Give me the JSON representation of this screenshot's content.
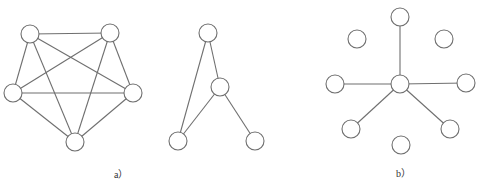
{
  "figure": {
    "panels": [
      {
        "id": "a",
        "caption": "a）",
        "graphs": [
          {
            "name": "complete-graph-k5",
            "nodes": [
              {
                "id": "n1",
                "x": 30,
                "y": 34
              },
              {
                "id": "n2",
                "x": 110,
                "y": 33
              },
              {
                "id": "n3",
                "x": 133,
                "y": 93
              },
              {
                "id": "n4",
                "x": 75,
                "y": 142
              },
              {
                "id": "n5",
                "x": 13,
                "y": 93
              }
            ],
            "edges": [
              [
                "n1",
                "n2"
              ],
              [
                "n1",
                "n3"
              ],
              [
                "n1",
                "n4"
              ],
              [
                "n1",
                "n5"
              ],
              [
                "n2",
                "n3"
              ],
              [
                "n2",
                "n4"
              ],
              [
                "n2",
                "n5"
              ],
              [
                "n3",
                "n4"
              ],
              [
                "n3",
                "n5"
              ],
              [
                "n4",
                "n5"
              ]
            ]
          },
          {
            "name": "small-graph",
            "nodes": [
              {
                "id": "m1",
                "x": 208,
                "y": 33
              },
              {
                "id": "m2",
                "x": 220,
                "y": 87
              },
              {
                "id": "m3",
                "x": 178,
                "y": 141
              },
              {
                "id": "m4",
                "x": 255,
                "y": 141
              }
            ],
            "edges": [
              [
                "m1",
                "m3"
              ],
              [
                "m1",
                "m2"
              ],
              [
                "m2",
                "m3"
              ],
              [
                "m2",
                "m4"
              ]
            ]
          }
        ]
      },
      {
        "id": "b",
        "caption": "b）",
        "graphs": [
          {
            "name": "star-graph-with-isolated-nodes",
            "nodes": [
              {
                "id": "c",
                "x": 400,
                "y": 84
              },
              {
                "id": "top",
                "x": 400,
                "y": 17
              },
              {
                "id": "ul",
                "x": 357,
                "y": 39
              },
              {
                "id": "ur",
                "x": 444,
                "y": 39
              },
              {
                "id": "left",
                "x": 335,
                "y": 84
              },
              {
                "id": "right",
                "x": 466,
                "y": 83
              },
              {
                "id": "ll",
                "x": 351,
                "y": 129
              },
              {
                "id": "lr",
                "x": 450,
                "y": 129
              },
              {
                "id": "bottom",
                "x": 401,
                "y": 145
              }
            ],
            "edges": [
              [
                "c",
                "top"
              ],
              [
                "c",
                "left"
              ],
              [
                "c",
                "right"
              ],
              [
                "c",
                "ll"
              ],
              [
                "c",
                "lr"
              ]
            ]
          }
        ]
      }
    ],
    "node_radius": 9,
    "stroke_color": "#6f6f6f",
    "node_fill": "#ffffff"
  }
}
